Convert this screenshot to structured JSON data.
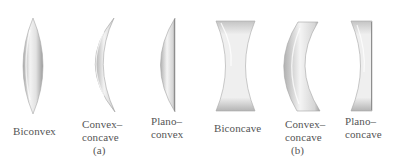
{
  "figure": {
    "groups": [
      {
        "id": "a",
        "caption": "(a)",
        "lenses": [
          {
            "name": "biconvex",
            "label_lines": [
              "Biconvex"
            ]
          },
          {
            "name": "convex-concave-a",
            "label_lines": [
              "Convex–",
              "concave"
            ]
          },
          {
            "name": "plano-convex",
            "label_lines": [
              "Plano–",
              "convex"
            ]
          }
        ]
      },
      {
        "id": "b",
        "caption": "(b)",
        "lenses": [
          {
            "name": "biconcave",
            "label_lines": [
              "Biconcave"
            ]
          },
          {
            "name": "convex-concave-b",
            "label_lines": [
              "Convex–",
              "concave"
            ]
          },
          {
            "name": "plano-concave",
            "label_lines": [
              "Plano–",
              "concave"
            ]
          }
        ]
      }
    ]
  },
  "colors": {
    "lens_light": "#f4f4f4",
    "lens_mid": "#cfcfcf",
    "lens_dark": "#9a9a9a",
    "label_text": "#555555",
    "background": "#ffffff"
  }
}
